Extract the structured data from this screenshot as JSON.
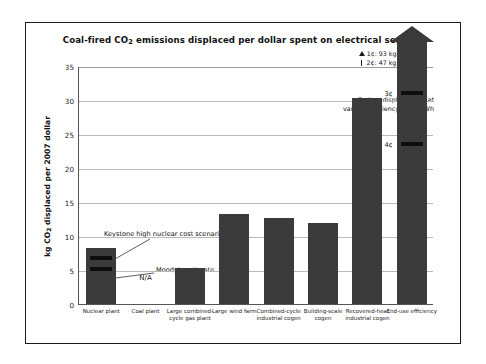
{
  "chart_data": {
    "type": "bar",
    "title": "Coal-fired CO2 emissions displaced per dollar spent on electrical services",
    "title_main": "Coal-fired CO",
    "title_sub": "2",
    "title_rest": " emissions displaced per dollar spent on electrical services",
    "xlabel": "",
    "ylabel": "kg CO2 displaced per 2007 dollar",
    "ylabel_main": "kg CO",
    "ylabel_sub": "2",
    "ylabel_rest": " displaced per 2007 dollar",
    "ylim": [
      0,
      35
    ],
    "yticks": [
      0,
      5,
      10,
      15,
      20,
      25,
      30,
      35
    ],
    "ytick_labels": [
      "0",
      "5",
      "10",
      "15",
      "20",
      "25",
      "30",
      "35"
    ],
    "grid": true,
    "legend_position": "top-right",
    "bar_color": "#3b3b3b",
    "categories": [
      "Nuclear plant",
      "Coal plant",
      "Large combined-cycle gas plant",
      "Large wind farm",
      "Combined-cycle industrial cogen",
      "Building-scale cogen",
      "Recovered-heat industrial cogen",
      "End-use efficiency"
    ],
    "category_label_lines": [
      [
        "Nuclear plant"
      ],
      [
        "Coal plant"
      ],
      [
        "Large combined-",
        "cycle gas plant"
      ],
      [
        "Large wind farm"
      ],
      [
        "Combined-cycle",
        "industrial cogen"
      ],
      [
        "Building-scale",
        "cogen"
      ],
      [
        "Recovered-heat",
        "industrial cogen"
      ],
      [
        "End-use efficiency"
      ]
    ],
    "values": [
      8.3,
      null,
      5.3,
      13.2,
      12.7,
      11.9,
      30.3,
      35.0
    ],
    "value_notes": [
      "",
      "N/A",
      "",
      "",
      "",
      "",
      "",
      "exceeds axis (arrow)"
    ],
    "na_label": "N/A",
    "markers": [
      {
        "category": "Nuclear plant",
        "value": 6.7,
        "label": "Keystone high nuclear cost scenario"
      },
      {
        "category": "Nuclear plant",
        "value": 5.1,
        "label": "Moody's estimate"
      },
      {
        "category": "End-use efficiency",
        "value": 31.0,
        "label": "3¢"
      },
      {
        "category": "End-use efficiency",
        "value": 23.5,
        "label": "4¢"
      }
    ],
    "annotations": [
      {
        "name": "keystone",
        "text": "Keystone high nuclear cost scenario"
      },
      {
        "name": "moody",
        "text": "Moody's estimate"
      },
      {
        "name": "carbon-displacement",
        "lines": [
          "Carbon displacement at",
          "various efficiency costs/kWh"
        ]
      }
    ],
    "legend_entries": [
      {
        "marker": "triangle",
        "text": "1¢: 93 kg CO2/$"
      },
      {
        "marker": "bar",
        "text": "2¢: 47 kg CO2/$"
      }
    ],
    "cost_tags": [
      {
        "text": "3¢",
        "value": 31.0
      },
      {
        "text": "4¢",
        "value": 23.5
      }
    ]
  }
}
